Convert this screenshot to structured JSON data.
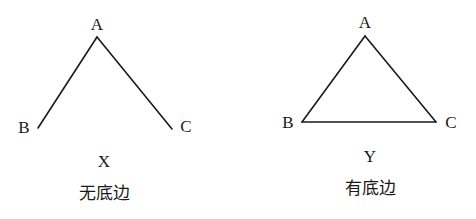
{
  "figures": [
    {
      "id": "X",
      "letter": "X",
      "caption": "无底边",
      "vertices": {
        "A": "A",
        "B": "B",
        "C": "C"
      },
      "edges": [
        "AB",
        "AC"
      ],
      "has_base": false
    },
    {
      "id": "Y",
      "letter": "Y",
      "caption": "有底边",
      "vertices": {
        "A": "A",
        "B": "B",
        "C": "C"
      },
      "edges": [
        "AB",
        "AC",
        "BC"
      ],
      "has_base": true
    }
  ]
}
